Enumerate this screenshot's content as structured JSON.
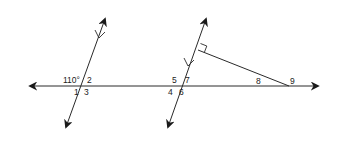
{
  "diagram": {
    "type": "geometry",
    "colors": {
      "stroke": "#2a2a2a",
      "background": "#ffffff"
    },
    "lines": {
      "horizontal": {
        "name": "transversal",
        "x1": 24,
        "y1": 86,
        "x2": 323,
        "y2": 86,
        "arrows": "both"
      },
      "left_parallel": {
        "name": "left parallel line",
        "x1": 107,
        "y1": 14,
        "x2": 64,
        "y2": 132,
        "arrows": "both",
        "parallel_mark": true
      },
      "right_parallel": {
        "name": "right parallel line",
        "x1": 208,
        "y1": 14,
        "x2": 166,
        "y2": 132,
        "arrows": "both",
        "parallel_mark": true
      },
      "perpendicular_segment": {
        "name": "perpendicular segment",
        "x1": 198,
        "y1": 50,
        "x2": 289,
        "y2": 86,
        "right_angle_at": "top"
      }
    },
    "angle_labels": {
      "given": "110°",
      "a2": "2",
      "a1": "1",
      "a3": "3",
      "a5": "5",
      "a7": "7",
      "a4": "4",
      "a6": "6",
      "a8": "8",
      "a9": "9"
    }
  }
}
